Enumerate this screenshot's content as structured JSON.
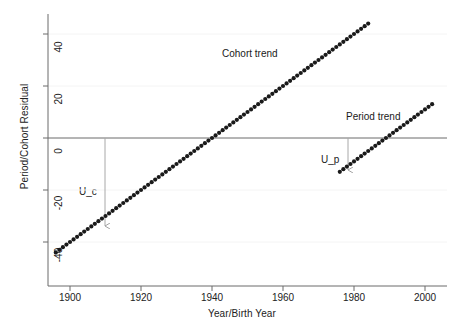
{
  "chart_data": {
    "type": "scatter",
    "title": "",
    "xlabel": "Year/Birth Year",
    "ylabel": "Period/Cohort Residual",
    "xlim": [
      1895,
      2004
    ],
    "ylim": [
      -46,
      46
    ],
    "xticks": [
      1900,
      1920,
      1940,
      1960,
      1980,
      2000
    ],
    "xtick_labels": [
      "1900",
      "1920",
      "1940",
      "1960",
      "1980",
      "2000"
    ],
    "yticks": [
      40,
      20,
      0,
      -20,
      -40
    ],
    "ytick_labels": [
      "40",
      "20",
      "0",
      "-20",
      "-40"
    ],
    "grid": "horizontal-faint",
    "legend": "none",
    "zero_line": 0,
    "marker": "filled-circle",
    "marker_color": "#1a1a1a",
    "series": [
      {
        "name": "Cohort trend",
        "x": [
          1896,
          1897,
          1898,
          1899,
          1900,
          1901,
          1902,
          1903,
          1904,
          1905,
          1906,
          1907,
          1908,
          1909,
          1910,
          1911,
          1912,
          1913,
          1914,
          1915,
          1916,
          1917,
          1918,
          1919,
          1920,
          1921,
          1922,
          1923,
          1924,
          1925,
          1926,
          1927,
          1928,
          1929,
          1930,
          1931,
          1932,
          1933,
          1934,
          1935,
          1936,
          1937,
          1938,
          1939,
          1940,
          1941,
          1942,
          1943,
          1944,
          1945,
          1946,
          1947,
          1948,
          1949,
          1950,
          1951,
          1952,
          1953,
          1954,
          1955,
          1956,
          1957,
          1958,
          1959,
          1960,
          1961,
          1962,
          1963,
          1964,
          1965,
          1966,
          1967,
          1968,
          1969,
          1970,
          1971,
          1972,
          1973,
          1974,
          1975,
          1976,
          1977,
          1978,
          1979,
          1980,
          1981,
          1982,
          1983,
          1984
        ],
        "y": [
          -44.0,
          -43.5,
          -43.0,
          -42.5,
          -42.0,
          -41.5,
          -41.0,
          -40.5,
          -40.0,
          -39.5,
          -39.0,
          -38.5,
          -38.0,
          -37.5,
          -37.0,
          -36.5,
          -36.0,
          -35.5,
          -35.0,
          -34.5,
          -34.0,
          -33.5,
          -33.0,
          -32.5,
          -32.0,
          -31.5,
          -31.0,
          -30.5,
          -30.0,
          -29.5,
          -29.0,
          -28.5,
          -28.0,
          -27.5,
          -27.0,
          -26.5,
          -26.0,
          -25.5,
          -25.0,
          -24.5,
          -24.0,
          -23.5,
          -23.0,
          -22.5,
          -22.0,
          -21.5,
          -21.0,
          -20.5,
          -20.0,
          -19.5,
          -19.0,
          -18.5,
          -18.0,
          -17.5,
          -17.0,
          -16.5,
          -16.0,
          -15.5,
          -15.0,
          -14.5,
          -14.0,
          -13.5,
          -13.0,
          -12.5,
          -12.0,
          -11.5,
          -11.0,
          -10.5,
          -10.0,
          -9.5,
          -9.0,
          -8.5,
          -8.0,
          -7.5,
          -7.0,
          -6.5,
          -6.0,
          -5.5,
          -5.0,
          -4.5,
          -4.0,
          -3.5,
          -3.0,
          -2.5,
          -2.0,
          -1.5,
          -1.0,
          -0.5,
          0.0
        ],
        "label": "Cohort trend",
        "slope_per_year": 1.0,
        "x_at_zero": 1940,
        "y_start": -44.0,
        "y_end": 44.0
      },
      {
        "name": "Period trend",
        "x": [
          1976,
          1977,
          1978,
          1979,
          1980,
          1981,
          1982,
          1983,
          1984,
          1985,
          1986,
          1987,
          1988,
          1989,
          1990,
          1991,
          1992,
          1993,
          1994,
          1995,
          1996,
          1997,
          1998,
          1999,
          2000,
          2001,
          2002
        ],
        "y": [
          -13.0,
          -12.0,
          -11.0,
          -10.0,
          -9.0,
          -8.0,
          -7.0,
          -6.0,
          -5.0,
          -4.0,
          -3.0,
          -2.0,
          -1.0,
          0.0,
          1.0,
          2.0,
          3.0,
          4.0,
          5.0,
          6.0,
          7.0,
          8.0,
          9.0,
          10.0,
          11.0,
          12.0,
          13.0
        ],
        "label": "Period trend",
        "slope_per_year": 1.0,
        "x_at_zero": 1989,
        "y_start": -13.0,
        "y_end": 13.0
      }
    ],
    "annotations": [
      {
        "name": "cohort-trend-label",
        "text": "Cohort trend",
        "x": 1952,
        "y": 28
      },
      {
        "name": "period-trend-label",
        "text": "Period trend",
        "x": 1987,
        "y": 15
      },
      {
        "name": "u-c-label",
        "text": "U_c",
        "x": 1908,
        "y": -16
      },
      {
        "name": "u-p-label",
        "text": "U_p",
        "x": 1976,
        "y": -8
      }
    ],
    "drop_lines": [
      {
        "name": "u-c-drop-line",
        "x": 1910,
        "y_top": 0,
        "y_bottom": -29.5,
        "arrow": "down"
      },
      {
        "name": "u-p-drop-line",
        "x": 1979,
        "y_top": 0,
        "y_bottom": -10.5,
        "arrow": "down"
      }
    ],
    "colors": {
      "marker": "#1a1a1a",
      "axis": "#666666",
      "zero_line": "#666666",
      "grid": "#f2f2f2",
      "drop_line": "#999999",
      "background": "#ffffff"
    }
  }
}
